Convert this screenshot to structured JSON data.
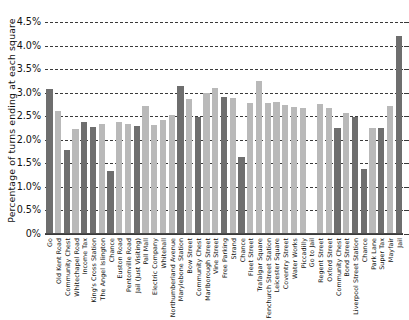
{
  "chart_data": {
    "type": "bar",
    "title": "",
    "xlabel": "",
    "ylabel": "Percentage of turns ending at each square",
    "ylim": [
      0,
      4.5
    ],
    "grid": true,
    "legend": "none",
    "y_ticks": [
      "0%",
      "0.5%",
      "1.0%",
      "1.5%",
      "2.0%",
      "2.5%",
      "3.0%",
      "3.5%",
      "4.0%",
      "4.5%"
    ],
    "y_tick_values": [
      0,
      0.5,
      1.0,
      1.5,
      2.0,
      2.5,
      3.0,
      3.5,
      4.0,
      4.5
    ],
    "unit": "%",
    "colors": {
      "dark": "#6e6e6e",
      "light": "#b9b9b9",
      "gridline": "#3a3a3a",
      "text": "#111111",
      "background": "#ffffff"
    },
    "categories": [
      "Go",
      "Old Kent Road",
      "Community Chest",
      "Whitechapel Road",
      "Income Tax",
      "King's Cross Station",
      "The Angel Islington",
      "Chance",
      "Euston Road",
      "Pentonville Road",
      "Jail (Just Visiting)",
      "Pall Mall",
      "Electric Company",
      "Whitehall",
      "Northumberland Avenue",
      "Marylebone Station",
      "Bow Street",
      "Community Chest",
      "Marlborough Street",
      "Vine Street",
      "Free Parking",
      "Strand",
      "Chance",
      "Fleet Street",
      "Trafalgar Square",
      "Fenchurch Street Station",
      "Leicester Square",
      "Coventry Street",
      "Water Works",
      "Piccadilly",
      "Go to Jail",
      "Regent Street",
      "Oxford Street",
      "Community Chest",
      "Bond Street",
      "Liverpool Street Station",
      "Chance",
      "Park Lane",
      "Super Tax",
      "Mayfair",
      "Jail"
    ],
    "values": [
      3.08,
      2.61,
      1.79,
      2.22,
      2.38,
      2.28,
      2.34,
      1.33,
      2.37,
      2.33,
      2.3,
      2.71,
      2.31,
      2.41,
      2.53,
      3.15,
      2.86,
      2.48,
      3.0,
      3.11,
      2.91,
      2.88,
      1.63,
      2.78,
      3.25,
      2.79,
      2.8,
      2.74,
      2.69,
      2.68,
      0.0,
      2.77,
      2.67,
      2.26,
      2.57,
      2.48,
      1.39,
      2.24,
      2.25,
      2.71,
      4.21
    ],
    "shades": [
      "dark",
      "light",
      "dark",
      "light",
      "dark",
      "dark",
      "light",
      "dark",
      "light",
      "light",
      "dark",
      "light",
      "light",
      "light",
      "light",
      "dark",
      "light",
      "dark",
      "light",
      "light",
      "dark",
      "light",
      "dark",
      "light",
      "light",
      "light",
      "light",
      "light",
      "light",
      "light",
      "none",
      "light",
      "light",
      "dark",
      "light",
      "dark",
      "dark",
      "light",
      "dark",
      "light",
      "dark"
    ]
  }
}
